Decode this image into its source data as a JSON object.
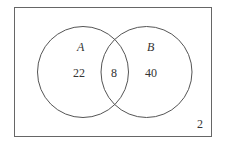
{
  "diagram": {
    "type": "venn",
    "universe_region": {
      "count": "2"
    },
    "sets": [
      {
        "name": "A",
        "only_count": "22"
      },
      {
        "name": "B",
        "only_count": "40"
      }
    ],
    "intersection": {
      "count": "8"
    },
    "colors": {
      "stroke": "#555555",
      "text": "#333333",
      "background": "#ffffff"
    }
  }
}
